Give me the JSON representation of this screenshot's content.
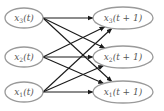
{
  "diagram": {
    "type": "fully-connected-time-step-graph",
    "colors": {
      "node_stroke": "#9a9a9a",
      "edge": "#1a1a1a",
      "text": "#555555"
    },
    "left_nodes": [
      {
        "id": "x3t",
        "var": "x",
        "sub": "3",
        "arg": "(t)",
        "cx": 24,
        "cy": 18
      },
      {
        "id": "x2t",
        "var": "x",
        "sub": "2",
        "arg": "(t)",
        "cx": 24,
        "cy": 57
      },
      {
        "id": "x1t",
        "var": "x",
        "sub": "1",
        "arg": "(t)",
        "cx": 24,
        "cy": 92
      }
    ],
    "right_nodes": [
      {
        "id": "x3t1",
        "var": "x",
        "sub": "3",
        "arg": "(t + 1)",
        "cx": 123,
        "cy": 18
      },
      {
        "id": "x2t1",
        "var": "x",
        "sub": "2",
        "arg": "(t + 1)",
        "cx": 123,
        "cy": 57
      },
      {
        "id": "x1t1",
        "var": "x",
        "sub": "1",
        "arg": "(t + 1)",
        "cx": 123,
        "cy": 92
      }
    ],
    "edges": [
      [
        "x3t",
        "x3t1"
      ],
      [
        "x3t",
        "x2t1"
      ],
      [
        "x3t",
        "x1t1"
      ],
      [
        "x2t",
        "x3t1"
      ],
      [
        "x2t",
        "x2t1"
      ],
      [
        "x2t",
        "x1t1"
      ],
      [
        "x1t",
        "x3t1"
      ],
      [
        "x1t",
        "x2t1"
      ],
      [
        "x1t",
        "x1t1"
      ]
    ]
  }
}
